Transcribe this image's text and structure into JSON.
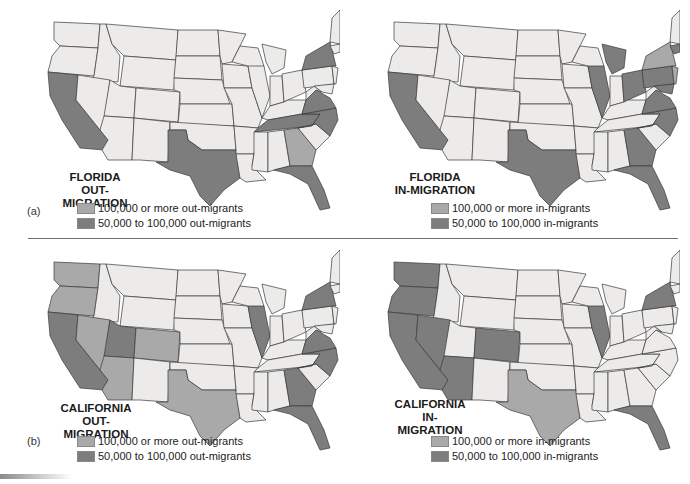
{
  "colors": {
    "base": "#ecebea",
    "level_high": "#a9a9a9",
    "level_mid": "#7d7d7d",
    "border": "#3a3a3a",
    "divider": "#6f6f6f"
  },
  "parts": [
    {
      "label": "(a)"
    },
    {
      "label": "(b)"
    }
  ],
  "maps": [
    {
      "id": "florida-out",
      "title_line1": "FLORIDA",
      "title_line2": "OUT-MIGRATION",
      "legend": [
        {
          "key": "high",
          "label": "100,000 or more out-migrants"
        },
        {
          "key": "mid",
          "label": "50,000 to 100,000 out-migrants"
        }
      ],
      "high_states": [
        "GA"
      ],
      "mid_states": [
        "CA",
        "TX",
        "TN",
        "NC",
        "VA",
        "NY",
        "FL"
      ]
    },
    {
      "id": "florida-in",
      "title_line1": "FLORIDA",
      "title_line2": "IN-MIGRATION",
      "legend": [
        {
          "key": "high",
          "label": "100,000 or more in-migrants"
        },
        {
          "key": "mid",
          "label": "50,000 to 100,000 in-migrants"
        }
      ],
      "high_states": [
        "NY",
        "NJ"
      ],
      "mid_states": [
        "CA",
        "TX",
        "IL",
        "MI",
        "OH",
        "PA",
        "VA",
        "NC",
        "GA",
        "MA",
        "MD",
        "FL"
      ]
    },
    {
      "id": "california-out",
      "title_line1": "CALIFORNIA",
      "title_line2": "OUT-MIGRATION",
      "legend": [
        {
          "key": "high",
          "label": "100,000 or more out-migrants"
        },
        {
          "key": "mid",
          "label": "50,000 to 100,000 out-migrants"
        }
      ],
      "high_states": [
        "WA",
        "OR",
        "NV",
        "AZ",
        "CO",
        "TX"
      ],
      "mid_states": [
        "CA",
        "UT",
        "IL",
        "NY",
        "VA",
        "NC",
        "GA",
        "FL"
      ]
    },
    {
      "id": "california-in",
      "title_line1": "CALIFORNIA",
      "title_line2": "IN-MIGRATION",
      "legend": [
        {
          "key": "high",
          "label": "100,000 or more in-migrants"
        },
        {
          "key": "mid",
          "label": "50,000 to 100,000 in-migrants"
        }
      ],
      "high_states": [
        "TX"
      ],
      "mid_states": [
        "CA",
        "WA",
        "OR",
        "NV",
        "AZ",
        "CO",
        "IL",
        "NY",
        "FL"
      ]
    }
  ]
}
